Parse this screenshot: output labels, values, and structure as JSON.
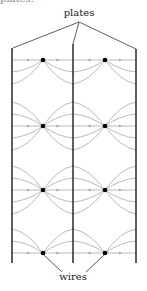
{
  "labels": {
    "top_cut": "plates.",
    "plates": "plates",
    "wires": "wires"
  },
  "colors": {
    "plate": "#1a1a1a",
    "field_line": "#a8a8a8",
    "wire": "#000000",
    "text": "#222222"
  },
  "geometry": {
    "plates_x": [
      12,
      73,
      136
    ],
    "plate_top_y": [
      48,
      44,
      49
    ],
    "plate_bottom_y": 263,
    "wire_columns_x": [
      43,
      105
    ],
    "wire_rows_y": [
      60,
      126,
      190,
      253
    ]
  }
}
